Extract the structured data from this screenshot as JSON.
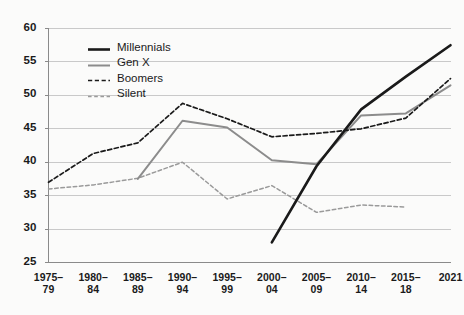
{
  "chart_data": {
    "type": "line",
    "title": "",
    "subtitle": "",
    "xlabel": "",
    "ylabel": "",
    "grid": true,
    "legend_position": "top-left-inside",
    "categories": [
      "1975–79",
      "1980–84",
      "1985–89",
      "1990–94",
      "1995–99",
      "2000–04",
      "2005–09",
      "2010–14",
      "2015–18",
      "2021"
    ],
    "xtick_lines": [
      [
        "1975–",
        "79"
      ],
      [
        "1980–",
        "84"
      ],
      [
        "1985–",
        "89"
      ],
      [
        "1990–",
        "94"
      ],
      [
        "1995–",
        "99"
      ],
      [
        "2000–",
        "04"
      ],
      [
        "2005–",
        "09"
      ],
      [
        "2010–",
        "14"
      ],
      [
        "2015–",
        "18"
      ],
      [
        "2021",
        ""
      ]
    ],
    "ylim": [
      25,
      60
    ],
    "yticks": [
      25,
      30,
      35,
      40,
      45,
      50,
      55,
      60
    ],
    "series": [
      {
        "name": "Millennials",
        "color": "#1a1a1a",
        "style": "solid",
        "width": 2.6,
        "x": [
          "2000–04",
          "2005–09",
          "2010–14",
          "2015–18",
          "2021"
        ],
        "values": [
          28.0,
          39.4,
          47.9,
          52.8,
          57.5
        ]
      },
      {
        "name": "Gen X",
        "color": "#8c8c8c",
        "style": "solid",
        "width": 2.0,
        "x": [
          "1985–89",
          "1990–94",
          "1995–99",
          "2000–04",
          "2005–09",
          "2010–14",
          "2015–18",
          "2021"
        ],
        "values": [
          37.5,
          46.2,
          45.2,
          40.3,
          39.7,
          47.0,
          47.3,
          51.5
        ]
      },
      {
        "name": "Boomers",
        "color": "#1a1a1a",
        "style": "dashed",
        "width": 1.7,
        "x": [
          "1975–79",
          "1980–84",
          "1985–89",
          "1990–94",
          "1995–99",
          "2000–04",
          "2005–09",
          "2010–14",
          "2015–18",
          "2021"
        ],
        "values": [
          37.0,
          41.3,
          42.9,
          48.8,
          46.5,
          43.8,
          44.3,
          45.0,
          46.6,
          52.5
        ]
      },
      {
        "name": "Silent",
        "color": "#9a9a9a",
        "style": "dashed",
        "width": 1.5,
        "x": [
          "1975–79",
          "1980–84",
          "1985–89",
          "1990–94",
          "1995–99",
          "2000–04",
          "2005–09",
          "2010–14",
          "2015–18"
        ],
        "values": [
          36.0,
          36.6,
          37.6,
          40.0,
          34.5,
          36.5,
          32.5,
          33.6,
          33.3
        ]
      }
    ],
    "legend": [
      {
        "label": "Millennials",
        "color": "#1a1a1a",
        "style": "solid",
        "width": 2.6
      },
      {
        "label": "Gen X",
        "color": "#8c8c8c",
        "style": "solid",
        "width": 2.0
      },
      {
        "label": "Boomers",
        "color": "#1a1a1a",
        "style": "dashed",
        "width": 1.7
      },
      {
        "label": "Silent",
        "color": "#9a9a9a",
        "style": "dashed",
        "width": 1.5
      }
    ],
    "colors": {
      "background": "#fbfbfa",
      "grid": "#c9c9c9",
      "axis": "#8a8a8a",
      "text": "#1a1a1a"
    }
  }
}
